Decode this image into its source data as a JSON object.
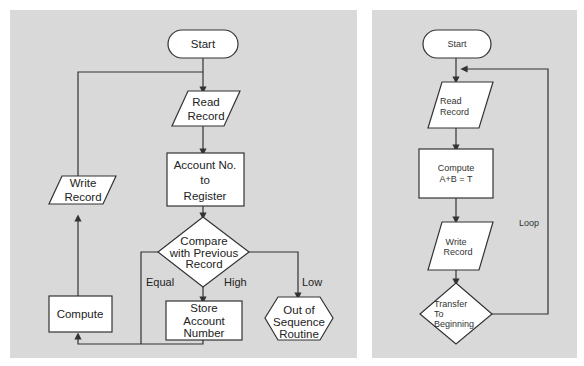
{
  "left_flowchart": {
    "nodes": {
      "start": {
        "shape": "terminator",
        "label": "Start"
      },
      "read_record": {
        "shape": "parallelogram",
        "lines": [
          "Read",
          "Record"
        ]
      },
      "account_to_register": {
        "shape": "rectangle",
        "lines": [
          "Account No.",
          "to",
          "Register"
        ]
      },
      "compare": {
        "shape": "diamond",
        "lines": [
          "Compare",
          "with Previous",
          "Record"
        ]
      },
      "store_account": {
        "shape": "rectangle",
        "lines": [
          "Store",
          "Account",
          "Number"
        ]
      },
      "out_of_sequence": {
        "shape": "hexagon",
        "lines": [
          "Out of",
          "Sequence",
          "Routine"
        ]
      },
      "compute": {
        "shape": "rectangle",
        "label": "Compute"
      },
      "write_record": {
        "shape": "parallelogram",
        "lines": [
          "Write",
          "Record"
        ]
      }
    },
    "edge_labels": {
      "equal": "Equal",
      "high": "High",
      "low": "Low"
    }
  },
  "right_flowchart": {
    "nodes": {
      "start": {
        "shape": "terminator",
        "label": "Start"
      },
      "read_record": {
        "shape": "parallelogram",
        "lines": [
          "Read",
          "Record"
        ]
      },
      "compute": {
        "shape": "rectangle",
        "lines": [
          "Compute",
          "A+B = T"
        ]
      },
      "write_record": {
        "shape": "parallelogram",
        "lines": [
          "Write",
          "Record"
        ]
      },
      "transfer": {
        "shape": "diamond",
        "lines": [
          "Transfer",
          "To",
          "Beginning"
        ]
      }
    },
    "edge_labels": {
      "loop": "Loop"
    }
  },
  "colors": {
    "panel_background": "#d9d9d9",
    "shape_fill": "#ffffff",
    "stroke": "#333333"
  }
}
